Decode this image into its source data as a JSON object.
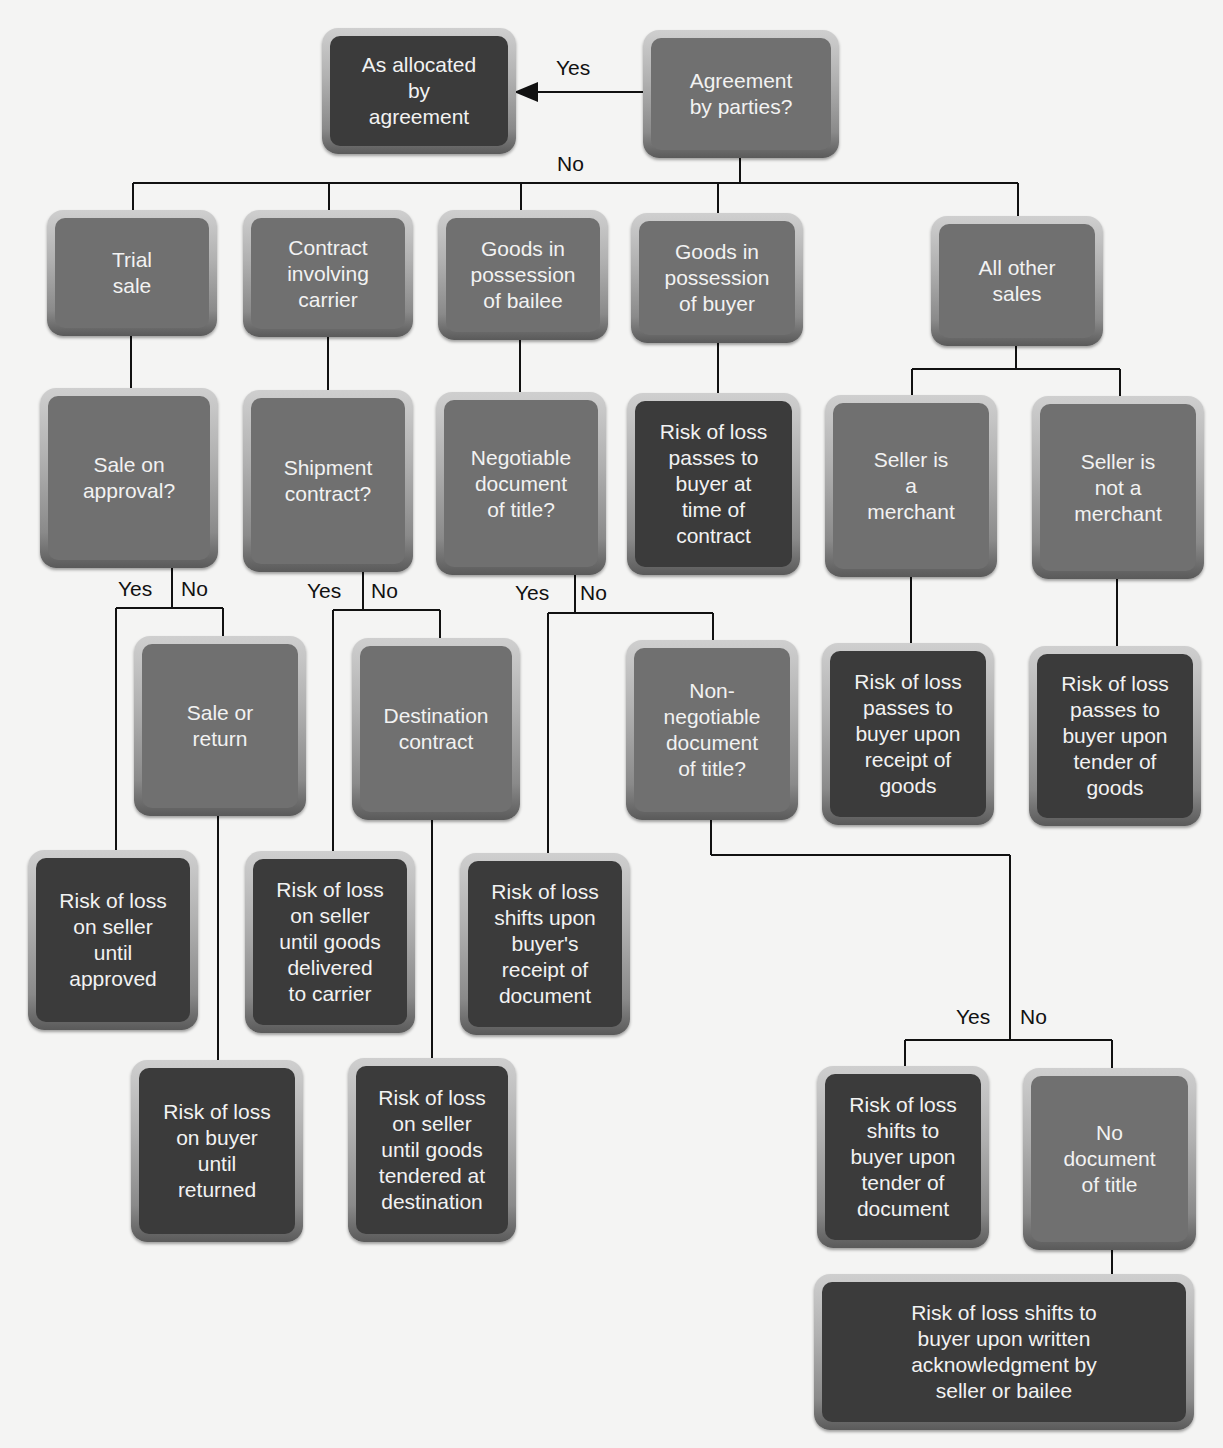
{
  "diagram": {
    "type": "decision-flowchart",
    "colors": {
      "question_box": "#707070",
      "result_box": "#3b3b3b",
      "box_text": "#f2f2f2",
      "connector": "#111111",
      "background": "#f4f4f3"
    },
    "nodes": {
      "agreement_q": "Agreement\nby parties?",
      "allocated": "As allocated\nby\nagreement",
      "trial_sale": "Trial\nsale",
      "carrier": "Contract\ninvolving\ncarrier",
      "bailee": "Goods in\npossession\nof bailee",
      "buyer_possession": "Goods in\npossession\nof buyer",
      "other_sales": "All other\nsales",
      "approval_q": "Sale on\napproval?",
      "shipment_q": "Shipment\ncontract?",
      "negotiable_q": "Negotiable\ndocument\nof title?",
      "risk_time_contract": "Risk of loss\npasses to\nbuyer at\ntime of\ncontract",
      "merchant": "Seller is\na\nmerchant",
      "not_merchant": "Seller is\nnot a\nmerchant",
      "sale_return": "Sale or\nreturn",
      "destination": "Destination\ncontract",
      "nonneg_q": "Non-\nnegotiable\ndocument\nof title?",
      "risk_receipt_goods": "Risk of loss\npasses to\nbuyer upon\nreceipt of\ngoods",
      "risk_tender_goods": "Risk of loss\npasses to\nbuyer upon\ntender of\ngoods",
      "risk_seller_approved": "Risk of loss\non seller\nuntil\napproved",
      "risk_seller_carrier": "Risk of loss\non seller\nuntil goods\ndelivered\nto carrier",
      "risk_receipt_document": "Risk of loss\nshifts upon\nbuyer's\nreceipt of\ndocument",
      "risk_buyer_returned": "Risk of loss\non buyer\nuntil\nreturned",
      "risk_seller_destination": "Risk of loss\non seller\nuntil goods\ntendered at\ndestination",
      "risk_tender_document": "Risk of loss\nshifts to\nbuyer upon\ntender of\ndocument",
      "no_document": "No\ndocument\nof title",
      "risk_written_ack": "Risk of loss shifts to\nbuyer upon written\nacknowledgment by\nseller or bailee"
    },
    "labels": {
      "top_yes": "Yes",
      "top_no": "No",
      "approval_yes": "Yes",
      "approval_no": "No",
      "shipment_yes": "Yes",
      "shipment_no": "No",
      "negotiable_yes": "Yes",
      "negotiable_no": "No",
      "nonneg_yes": "Yes",
      "nonneg_no": "No"
    }
  }
}
